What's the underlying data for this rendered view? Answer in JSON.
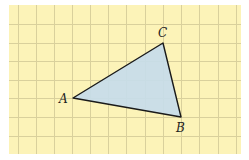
{
  "figure": {
    "type": "triangle-on-grid",
    "colors": {
      "page_background": "#ffffff",
      "grid_background": "#fcf3b8",
      "grid_line": "#d9d09c",
      "triangle_fill": "#c7dcea",
      "triangle_stroke": "#1a1a1a",
      "label": "#222222"
    },
    "grid": {
      "x0": 9,
      "y0": 5,
      "x1": 241,
      "y1": 154,
      "vertical_lines": [
        18,
        36,
        54,
        72,
        90,
        108,
        126,
        145,
        163,
        181,
        199,
        218,
        236
      ],
      "horizontal_lines": [
        24,
        43,
        61,
        80,
        98,
        117,
        136
      ]
    },
    "vertices": [
      {
        "name": "A",
        "x": 73,
        "y": 98,
        "label": "A",
        "label_x": 59,
        "label_y": 103
      },
      {
        "name": "B",
        "x": 181,
        "y": 117,
        "label": "B",
        "label_x": 176,
        "label_y": 132
      },
      {
        "name": "C",
        "x": 163,
        "y": 43,
        "label": "C",
        "label_x": 158,
        "label_y": 37
      }
    ]
  }
}
